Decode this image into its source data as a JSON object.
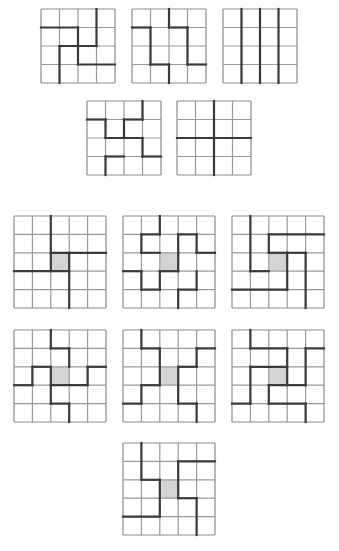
{
  "colors": {
    "thin": "#9a9a9a",
    "bold": "#3a3a3a",
    "shade": "#d4d4d4",
    "border": "#8c8c8c"
  },
  "grids": [
    {
      "id": "g4-1",
      "n": 4,
      "x": 41,
      "y": 9,
      "size": 74,
      "shade": null,
      "segments": [
        [
          3,
          0,
          3,
          2
        ],
        [
          0,
          1,
          2,
          1
        ],
        [
          2,
          1,
          2,
          2
        ],
        [
          1,
          2,
          3,
          2
        ],
        [
          1,
          2,
          1,
          4
        ],
        [
          2,
          2,
          2,
          3
        ],
        [
          2,
          3,
          4,
          3
        ]
      ]
    },
    {
      "id": "g4-2",
      "n": 4,
      "x": 132,
      "y": 9,
      "size": 74,
      "shade": null,
      "segments": [
        [
          2,
          0,
          2,
          1
        ],
        [
          0,
          1,
          1,
          1
        ],
        [
          1,
          1,
          1,
          3
        ],
        [
          1,
          3,
          2,
          3
        ],
        [
          2,
          3,
          2,
          4
        ],
        [
          2,
          1,
          3,
          1
        ],
        [
          3,
          1,
          3,
          3
        ],
        [
          3,
          3,
          4,
          3
        ]
      ]
    },
    {
      "id": "g4-3",
      "n": 4,
      "x": 223,
      "y": 9,
      "size": 74,
      "shade": null,
      "segments": [
        [
          1,
          0,
          1,
          4
        ],
        [
          2,
          0,
          2,
          4
        ],
        [
          3,
          0,
          3,
          4
        ]
      ]
    },
    {
      "id": "g4-4",
      "n": 4,
      "x": 87,
      "y": 101,
      "size": 74,
      "shade": null,
      "segments": [
        [
          3,
          0,
          3,
          1
        ],
        [
          0,
          1,
          1,
          1
        ],
        [
          2,
          1,
          3,
          1
        ],
        [
          1,
          1,
          1,
          2
        ],
        [
          2,
          1,
          2,
          2
        ],
        [
          1,
          2,
          3,
          2
        ],
        [
          3,
          2,
          3,
          3
        ],
        [
          1,
          3,
          2,
          3
        ],
        [
          1,
          3,
          1,
          4
        ],
        [
          3,
          3,
          4,
          3
        ]
      ]
    },
    {
      "id": "g4-5",
      "n": 4,
      "x": 177,
      "y": 101,
      "size": 74,
      "shade": null,
      "segments": [
        [
          2,
          0,
          2,
          4
        ],
        [
          0,
          2,
          4,
          2
        ]
      ]
    },
    {
      "id": "g5-a",
      "n": 5,
      "x": 14,
      "y": 216,
      "size": 92,
      "shade": [
        2,
        2
      ],
      "segments": [
        [
          2,
          0,
          2,
          3
        ],
        [
          2,
          2,
          5,
          2
        ],
        [
          3,
          2,
          3,
          5
        ],
        [
          0,
          3,
          3,
          3
        ]
      ]
    },
    {
      "id": "g5-b",
      "n": 5,
      "x": 123,
      "y": 216,
      "size": 92,
      "shade": [
        2,
        2
      ],
      "segments": [
        [
          2,
          0,
          2,
          1
        ],
        [
          1,
          1,
          2,
          1
        ],
        [
          1,
          1,
          1,
          2
        ],
        [
          1,
          2,
          2,
          2
        ],
        [
          3,
          1,
          4,
          1
        ],
        [
          3,
          1,
          3,
          2
        ],
        [
          4,
          1,
          4,
          2
        ],
        [
          4,
          2,
          5,
          2
        ],
        [
          0,
          3,
          1,
          3
        ],
        [
          1,
          3,
          1,
          4
        ],
        [
          1,
          4,
          2,
          4
        ],
        [
          2,
          3,
          2,
          4
        ],
        [
          3,
          4,
          4,
          4
        ],
        [
          4,
          3,
          4,
          4
        ],
        [
          3,
          4,
          3,
          5
        ],
        [
          2,
          3,
          3,
          3
        ],
        [
          3,
          2,
          3,
          3
        ]
      ]
    },
    {
      "id": "g5-c",
      "n": 5,
      "x": 232,
      "y": 216,
      "size": 92,
      "shade": [
        2,
        2
      ],
      "segments": [
        [
          1,
          0,
          1,
          3
        ],
        [
          1,
          3,
          2,
          3
        ],
        [
          2,
          1,
          5,
          1
        ],
        [
          2,
          1,
          2,
          2
        ],
        [
          2,
          2,
          3,
          2
        ],
        [
          3,
          2,
          4,
          2
        ],
        [
          4,
          2,
          4,
          5
        ],
        [
          0,
          4,
          3,
          4
        ],
        [
          3,
          2,
          3,
          4
        ]
      ]
    },
    {
      "id": "g5-d",
      "n": 5,
      "x": 14,
      "y": 330,
      "size": 92,
      "shade": [
        2,
        2
      ],
      "segments": [
        [
          2,
          0,
          2,
          1
        ],
        [
          2,
          1,
          3,
          1
        ],
        [
          3,
          1,
          3,
          2
        ],
        [
          1,
          2,
          2,
          2
        ],
        [
          1,
          2,
          1,
          3
        ],
        [
          0,
          3,
          1,
          3
        ],
        [
          2,
          2,
          2,
          4
        ],
        [
          2,
          4,
          3,
          4
        ],
        [
          3,
          4,
          3,
          5
        ],
        [
          2,
          3,
          4,
          3
        ],
        [
          4,
          2,
          4,
          3
        ],
        [
          4,
          2,
          5,
          2
        ]
      ]
    },
    {
      "id": "g5-e",
      "n": 5,
      "x": 123,
      "y": 330,
      "size": 92,
      "shade": [
        2,
        2
      ],
      "segments": [
        [
          1,
          0,
          1,
          1
        ],
        [
          1,
          1,
          2,
          1
        ],
        [
          2,
          1,
          2,
          3
        ],
        [
          4,
          1,
          5,
          1
        ],
        [
          4,
          1,
          4,
          2
        ],
        [
          3,
          2,
          4,
          2
        ],
        [
          3,
          2,
          3,
          4
        ],
        [
          1,
          3,
          2,
          3
        ],
        [
          1,
          3,
          1,
          4
        ],
        [
          0,
          4,
          1,
          4
        ],
        [
          3,
          4,
          4,
          4
        ],
        [
          4,
          4,
          4,
          5
        ]
      ]
    },
    {
      "id": "g5-f",
      "n": 5,
      "x": 232,
      "y": 330,
      "size": 92,
      "shade": [
        2,
        2
      ],
      "segments": [
        [
          1,
          0,
          1,
          1
        ],
        [
          1,
          1,
          3,
          1
        ],
        [
          3,
          1,
          3,
          3
        ],
        [
          4,
          1,
          5,
          1
        ],
        [
          4,
          1,
          4,
          3
        ],
        [
          1,
          2,
          3,
          2
        ],
        [
          1,
          2,
          1,
          4
        ],
        [
          0,
          4,
          1,
          4
        ],
        [
          2,
          3,
          4,
          3
        ],
        [
          2,
          3,
          2,
          4
        ],
        [
          2,
          4,
          4,
          4
        ],
        [
          4,
          4,
          4,
          5
        ]
      ]
    },
    {
      "id": "g5-g",
      "n": 5,
      "x": 123,
      "y": 443,
      "size": 92,
      "shade": [
        2,
        2
      ],
      "segments": [
        [
          1,
          0,
          1,
          2
        ],
        [
          1,
          2,
          2,
          2
        ],
        [
          2,
          2,
          2,
          4
        ],
        [
          0,
          4,
          2,
          4
        ],
        [
          3,
          1,
          5,
          1
        ],
        [
          3,
          1,
          3,
          3
        ],
        [
          3,
          3,
          4,
          3
        ],
        [
          4,
          3,
          4,
          5
        ]
      ]
    }
  ]
}
